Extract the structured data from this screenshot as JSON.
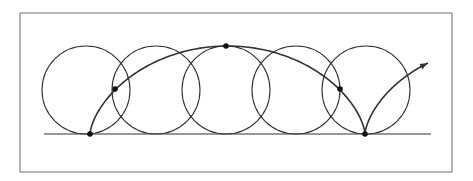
{
  "diagram": {
    "type": "cycloid",
    "title": "",
    "colors": {
      "background": "#ffffff",
      "frame": "#888888",
      "stroke": "#333333",
      "dot": "#111111"
    },
    "frame": {
      "x": 20,
      "y": 13,
      "width": 432,
      "height": 159
    },
    "baseline": {
      "x1": 44,
      "x2": 431,
      "y": 134
    },
    "rolling_circle_radius": 44,
    "circle_centers_x": [
      86,
      156,
      226,
      296,
      366
    ],
    "circle_center_y": 90,
    "cycloid": {
      "start_x": 90,
      "cusp_x": 365,
      "base_y": 134,
      "radius": 44
    },
    "marked_points": [
      {
        "x": 90,
        "y": 134,
        "label": "start-cusp"
      },
      {
        "x": 115,
        "y": 89,
        "label": "quarter"
      },
      {
        "x": 226,
        "y": 46,
        "label": "apex"
      },
      {
        "x": 340,
        "y": 89,
        "label": "three-quarter"
      },
      {
        "x": 365,
        "y": 134,
        "label": "end-cusp"
      }
    ],
    "arrow_tip": {
      "x": 429,
      "y": 59
    }
  }
}
